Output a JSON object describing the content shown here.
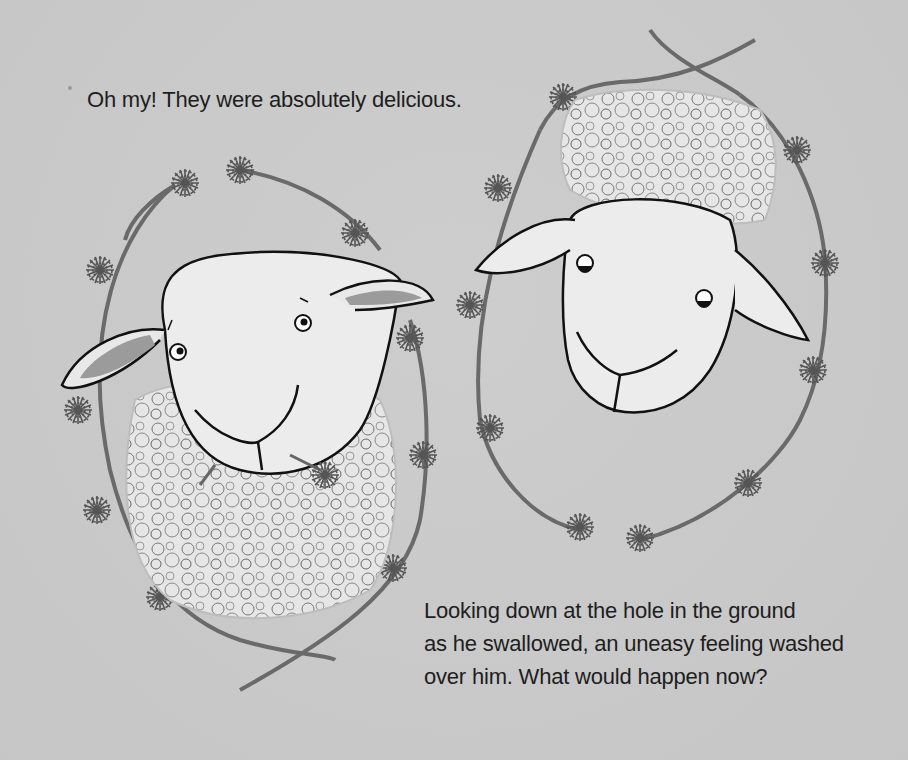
{
  "page": {
    "background_color": "#c9c9c9",
    "text_color": "#1e1e1e"
  },
  "caption_top": {
    "text": "Oh my! They were absolutely delicious."
  },
  "caption_bottom": {
    "lines": [
      "Looking down at the hole in the ground",
      "as he swallowed, an uneasy feeling washed",
      "over him. What would happen now?"
    ]
  },
  "illustration": {
    "left_panel": {
      "subject": "sheep with wool body, chewing a dandelion, looking up-right",
      "frame": "dandelion-chain wreath"
    },
    "right_panel": {
      "subject": "sheep head with curly wool topknot, eyes glancing sideways",
      "frame": "dandelion-chain wreath"
    }
  }
}
